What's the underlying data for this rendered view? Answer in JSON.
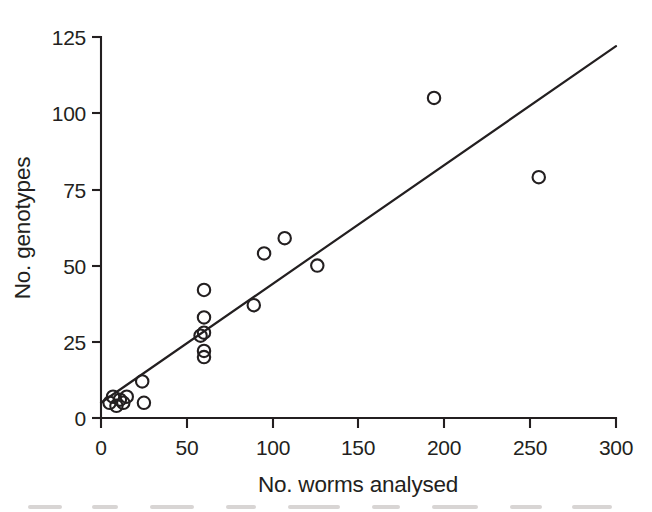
{
  "chart_data": {
    "type": "scatter",
    "title": "",
    "xlabel": "No. worms analysed",
    "ylabel": "No. genotypes",
    "xlim": [
      0,
      300
    ],
    "ylim": [
      0,
      125
    ],
    "xticks": [
      0,
      50,
      100,
      150,
      200,
      250,
      300
    ],
    "yticks": [
      0,
      25,
      50,
      75,
      100,
      125
    ],
    "xtick_labels": [
      "0",
      "50",
      "100",
      "150",
      "200",
      "250",
      "300"
    ],
    "ytick_labels": [
      "0",
      "25",
      "50",
      "75",
      "100",
      "125"
    ],
    "grid": false,
    "legend": "none",
    "marker_style": "open-circle",
    "marker_color": "#231f20",
    "points": [
      {
        "x": 5,
        "y": 5
      },
      {
        "x": 7,
        "y": 7
      },
      {
        "x": 9,
        "y": 4
      },
      {
        "x": 11,
        "y": 6
      },
      {
        "x": 13,
        "y": 5
      },
      {
        "x": 15,
        "y": 7
      },
      {
        "x": 24,
        "y": 12
      },
      {
        "x": 25,
        "y": 5
      },
      {
        "x": 58,
        "y": 27
      },
      {
        "x": 60,
        "y": 42
      },
      {
        "x": 60,
        "y": 33
      },
      {
        "x": 60,
        "y": 28
      },
      {
        "x": 60,
        "y": 22
      },
      {
        "x": 60,
        "y": 20
      },
      {
        "x": 89,
        "y": 37
      },
      {
        "x": 95,
        "y": 54
      },
      {
        "x": 107,
        "y": 59
      },
      {
        "x": 126,
        "y": 50
      },
      {
        "x": 194,
        "y": 105
      },
      {
        "x": 255,
        "y": 79
      }
    ],
    "fit_line": {
      "type": "linear-regression",
      "x_start": 0,
      "y_start": 5,
      "x_end": 300,
      "y_end": 122,
      "slope": 0.39,
      "intercept": 5
    }
  }
}
